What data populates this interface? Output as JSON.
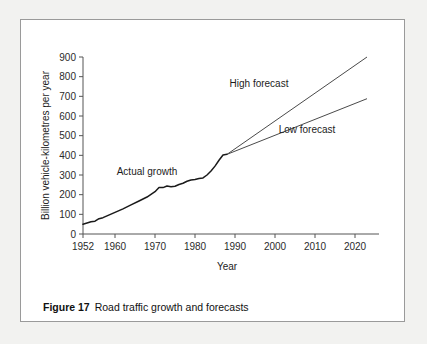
{
  "figure": {
    "caption_number": "Figure 17",
    "caption_text": "Road traffic growth and forecasts"
  },
  "chart_data": {
    "type": "line",
    "title": "",
    "xlabel": "Year",
    "ylabel": "Billion vehicle-kilometres per year",
    "xlim": [
      1952,
      2024
    ],
    "ylim": [
      0,
      900
    ],
    "grid": false,
    "legend": "annotations-inline",
    "xticks": [
      1952,
      1960,
      1970,
      1980,
      1990,
      2000,
      2010,
      2020
    ],
    "xtick_labels": [
      "1952",
      "1960",
      "1970",
      "1980",
      "1990",
      "2000",
      "2010",
      "2020"
    ],
    "yticks": [
      0,
      100,
      200,
      300,
      400,
      500,
      600,
      700,
      800,
      900
    ],
    "ytick_labels": [
      "0",
      "100",
      "200",
      "300",
      "400",
      "500",
      "600",
      "700",
      "800",
      "900"
    ],
    "annotations": [
      {
        "text": "Actual growth",
        "x": 1968,
        "y": 300
      },
      {
        "text": "High forecast",
        "x": 1996,
        "y": 745
      },
      {
        "text": "Low forecast",
        "x": 2008,
        "y": 515
      }
    ],
    "series": [
      {
        "name": "Actual growth",
        "style": "solid-thick",
        "x": [
          1952,
          1954,
          1955,
          1956,
          1957,
          1958,
          1960,
          1962,
          1964,
          1966,
          1968,
          1970,
          1971,
          1972,
          1973,
          1974,
          1975,
          1976,
          1977,
          1978,
          1979,
          1980,
          1981,
          1982,
          1983,
          1984,
          1985,
          1986,
          1987,
          1988
        ],
        "y": [
          50,
          62,
          65,
          78,
          83,
          92,
          110,
          128,
          148,
          168,
          188,
          215,
          236,
          236,
          244,
          240,
          243,
          252,
          258,
          268,
          275,
          277,
          282,
          285,
          300,
          320,
          345,
          375,
          402,
          405
        ]
      },
      {
        "name": "High forecast",
        "style": "solid-thin",
        "x": [
          1988,
          2023
        ],
        "y": [
          405,
          900
        ]
      },
      {
        "name": "Low forecast",
        "style": "solid-thin",
        "x": [
          1988,
          2023
        ],
        "y": [
          405,
          688
        ]
      }
    ]
  }
}
